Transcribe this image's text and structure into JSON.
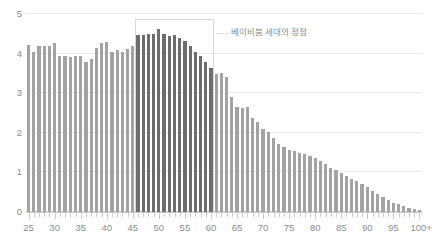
{
  "chart_data": {
    "type": "bar",
    "title": "",
    "subtitle": "",
    "xlabel": "",
    "ylabel": "",
    "ylim": [
      0,
      5
    ],
    "yticks": [
      0,
      1,
      2,
      3,
      4,
      5
    ],
    "ytick_labels": [
      "0",
      "1",
      "2",
      "3",
      "4",
      "5"
    ],
    "grid": true,
    "legend_position": "none",
    "xtick_labels": [
      "25",
      "30",
      "35",
      "40",
      "45",
      "50",
      "55",
      "60",
      "65",
      "70",
      "75",
      "80",
      "85",
      "90",
      "95",
      "100+"
    ],
    "xtick_values": [
      25,
      30,
      35,
      40,
      45,
      50,
      55,
      60,
      65,
      70,
      75,
      80,
      85,
      90,
      95,
      100
    ],
    "categories": [
      "25",
      "26",
      "27",
      "28",
      "29",
      "30",
      "31",
      "32",
      "33",
      "34",
      "35",
      "36",
      "37",
      "38",
      "39",
      "40",
      "41",
      "42",
      "43",
      "44",
      "45",
      "46",
      "47",
      "48",
      "49",
      "50",
      "51",
      "52",
      "53",
      "54",
      "55",
      "56",
      "57",
      "58",
      "59",
      "60",
      "61",
      "62",
      "63",
      "64",
      "65",
      "66",
      "67",
      "68",
      "69",
      "70",
      "71",
      "72",
      "73",
      "74",
      "75",
      "76",
      "77",
      "78",
      "79",
      "80",
      "81",
      "82",
      "83",
      "84",
      "85",
      "86",
      "87",
      "88",
      "89",
      "90",
      "91",
      "92",
      "93",
      "94",
      "95",
      "96",
      "97",
      "98",
      "99",
      "100+"
    ],
    "values": [
      4.22,
      4.05,
      4.18,
      4.18,
      4.2,
      4.26,
      3.95,
      3.93,
      3.92,
      3.94,
      3.93,
      3.78,
      3.86,
      4.13,
      4.28,
      4.3,
      4.05,
      4.08,
      4.05,
      4.12,
      4.2,
      4.48,
      4.47,
      4.5,
      4.5,
      4.62,
      4.5,
      4.44,
      4.46,
      4.4,
      4.32,
      4.18,
      4.04,
      3.93,
      3.8,
      3.64,
      3.48,
      3.52,
      3.42,
      2.9,
      2.66,
      2.63,
      2.65,
      2.37,
      2.27,
      2.1,
      2.03,
      1.86,
      1.72,
      1.64,
      1.57,
      1.54,
      1.5,
      1.46,
      1.42,
      1.36,
      1.3,
      1.22,
      1.12,
      1.05,
      0.98,
      0.92,
      0.84,
      0.78,
      0.7,
      0.62,
      0.54,
      0.46,
      0.38,
      0.31,
      0.24,
      0.19,
      0.15,
      0.11,
      0.08,
      0.06
    ],
    "series_colors": {
      "default": "#a3a3a3",
      "highlight": "#6d6d6d"
    },
    "highlight_range": {
      "start_category": "46",
      "end_category": "60",
      "label": "베이비붐 세대의 정점"
    },
    "annotations": [
      {
        "name": "baby-boom-peak",
        "text": "베이비붐 세대의 정점",
        "from_category": "46",
        "to_category": "60"
      }
    ]
  },
  "colors": {
    "bar_default": "#a3a3a3",
    "bar_highlight": "#6d6d6d",
    "gridline": "#e8e8e8",
    "axis": "#c9c9c9",
    "tick_text": "#8d8d8d",
    "annotation_text": "#8a8a8a",
    "annotation_line": "#d8d8d8",
    "background": "#ffffff"
  }
}
